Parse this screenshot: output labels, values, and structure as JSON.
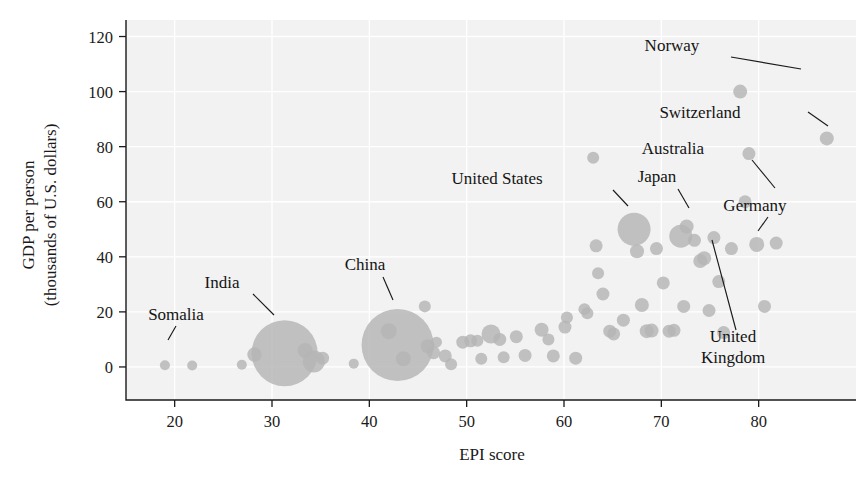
{
  "chart_data": {
    "type": "scatter",
    "title": "",
    "xlabel": "EPI score",
    "ylabel": "GDP per person\n(thousands of U.S. dollars)",
    "ylabel_line1": "GDP per person",
    "ylabel_line2": "(thousands of U.S. dollars)",
    "xlim": [
      15,
      90
    ],
    "ylim": [
      -12,
      126
    ],
    "xticks": [
      20,
      30,
      40,
      50,
      60,
      70,
      80
    ],
    "yticks": [
      0,
      20,
      40,
      60,
      80,
      100,
      120
    ],
    "grid": true,
    "legend": "none",
    "bubble_note": "Marker area encodes population",
    "colors": {
      "bubble": "#b4b4b4",
      "plot_background": "#f2f2f2",
      "gridline": "#ffffff",
      "axis": "#1a1a1a",
      "text": "#141414"
    },
    "annotations": [
      {
        "label": "Somalia",
        "lines": [
          "Somalia"
        ],
        "text_x": 176,
        "text_y": 320,
        "leader": [
          [
            176,
            326
          ],
          [
            168,
            340
          ]
        ]
      },
      {
        "label": "India",
        "lines": [
          "India"
        ],
        "text_x": 222,
        "text_y": 288,
        "leader": [
          [
            253,
            294
          ],
          [
            274,
            315
          ]
        ]
      },
      {
        "label": "China",
        "lines": [
          "China"
        ],
        "text_x": 365,
        "text_y": 270,
        "leader": [
          [
            383,
            277
          ],
          [
            393,
            300
          ]
        ]
      },
      {
        "label": "United States",
        "lines": [
          "United States"
        ],
        "text_x": 497,
        "text_y": 184,
        "leader": [
          [
            613,
            190
          ],
          [
            628,
            206
          ]
        ]
      },
      {
        "label": "Japan",
        "lines": [
          "Japan"
        ],
        "text_x": 657,
        "text_y": 182,
        "leader": [
          [
            678,
            189
          ],
          [
            689,
            208
          ]
        ]
      },
      {
        "label": "Australia",
        "lines": [
          "Australia"
        ],
        "text_x": 673,
        "text_y": 154,
        "leader": [
          [
            752,
            160
          ],
          [
            775,
            188
          ]
        ]
      },
      {
        "label": "Germany",
        "lines": [
          "Germany"
        ],
        "text_x": 755,
        "text_y": 211,
        "leader": [
          [
            768,
            217
          ],
          [
            758,
            231
          ]
        ]
      },
      {
        "label": "Switzerland",
        "lines": [
          "Switzerland"
        ],
        "text_x": 700,
        "text_y": 118,
        "leader": [
          [
            808,
            112
          ],
          [
            828,
            126
          ]
        ]
      },
      {
        "label": "Norway",
        "lines": [
          "Norway"
        ],
        "text_x": 672,
        "text_y": 51,
        "leader": [
          [
            731,
            57
          ],
          [
            801,
            69
          ]
        ]
      },
      {
        "label": "United Kingdom",
        "lines": [
          "United",
          "Kingdom"
        ],
        "text_x": 733,
        "text_y": 342,
        "leader": [
          [
            736,
            330
          ],
          [
            712,
            240
          ]
        ]
      }
    ],
    "points": [
      {
        "epi": 19.0,
        "gdp": 0.6,
        "r": 5.0,
        "name": "Somalia"
      },
      {
        "epi": 21.8,
        "gdp": 0.5,
        "r": 5.0
      },
      {
        "epi": 26.9,
        "gdp": 0.8,
        "r": 5.0
      },
      {
        "epi": 28.2,
        "gdp": 4.5,
        "r": 7.2
      },
      {
        "epi": 31.3,
        "gdp": 5.0,
        "r": 33.0,
        "name": "India"
      },
      {
        "epi": 33.4,
        "gdp": 6.0,
        "r": 7.5
      },
      {
        "epi": 34.3,
        "gdp": 2.0,
        "r": 11.0
      },
      {
        "epi": 35.2,
        "gdp": 3.2,
        "r": 6.5
      },
      {
        "epi": 38.4,
        "gdp": 1.2,
        "r": 5.0
      },
      {
        "epi": 42.9,
        "gdp": 8.0,
        "r": 36.0,
        "name": "China"
      },
      {
        "epi": 42.0,
        "gdp": 13.0,
        "r": 8.0
      },
      {
        "epi": 43.5,
        "gdp": 3.0,
        "r": 7.5
      },
      {
        "epi": 45.7,
        "gdp": 22.0,
        "r": 6.0
      },
      {
        "epi": 46.0,
        "gdp": 7.5,
        "r": 7.0
      },
      {
        "epi": 46.6,
        "gdp": 5.2,
        "r": 6.5
      },
      {
        "epi": 46.9,
        "gdp": 9.0,
        "r": 5.5
      },
      {
        "epi": 47.8,
        "gdp": 4.0,
        "r": 6.5
      },
      {
        "epi": 48.4,
        "gdp": 1.0,
        "r": 6.0
      },
      {
        "epi": 49.6,
        "gdp": 9.0,
        "r": 6.5
      },
      {
        "epi": 50.4,
        "gdp": 9.5,
        "r": 6.5
      },
      {
        "epi": 51.1,
        "gdp": 9.5,
        "r": 6.0
      },
      {
        "epi": 51.5,
        "gdp": 3.0,
        "r": 6.0
      },
      {
        "epi": 52.5,
        "gdp": 12.0,
        "r": 9.5
      },
      {
        "epi": 53.4,
        "gdp": 10.0,
        "r": 6.5
      },
      {
        "epi": 53.8,
        "gdp": 3.5,
        "r": 6.0
      },
      {
        "epi": 55.1,
        "gdp": 11.0,
        "r": 6.5
      },
      {
        "epi": 56.0,
        "gdp": 4.2,
        "r": 6.5
      },
      {
        "epi": 57.7,
        "gdp": 13.5,
        "r": 7.0
      },
      {
        "epi": 58.4,
        "gdp": 10.0,
        "r": 6.0
      },
      {
        "epi": 58.9,
        "gdp": 4.0,
        "r": 6.5
      },
      {
        "epi": 60.3,
        "gdp": 18.0,
        "r": 6.0
      },
      {
        "epi": 60.1,
        "gdp": 14.5,
        "r": 6.5
      },
      {
        "epi": 61.2,
        "gdp": 3.2,
        "r": 6.5
      },
      {
        "epi": 62.1,
        "gdp": 21.0,
        "r": 6.0
      },
      {
        "epi": 62.4,
        "gdp": 19.5,
        "r": 6.0
      },
      {
        "epi": 63.0,
        "gdp": 76.0,
        "r": 6.0
      },
      {
        "epi": 63.3,
        "gdp": 44.0,
        "r": 6.5
      },
      {
        "epi": 63.5,
        "gdp": 34.0,
        "r": 6.0
      },
      {
        "epi": 64.0,
        "gdp": 26.5,
        "r": 6.5
      },
      {
        "epi": 64.7,
        "gdp": 13.0,
        "r": 6.5
      },
      {
        "epi": 65.1,
        "gdp": 12.0,
        "r": 6.5
      },
      {
        "epi": 66.1,
        "gdp": 17.0,
        "r": 6.5
      },
      {
        "epi": 67.2,
        "gdp": 50.0,
        "r": 16.5,
        "name": "United States"
      },
      {
        "epi": 67.5,
        "gdp": 42.0,
        "r": 7.0
      },
      {
        "epi": 68.0,
        "gdp": 22.5,
        "r": 7.0
      },
      {
        "epi": 68.5,
        "gdp": 13.0,
        "r": 7.0
      },
      {
        "epi": 69.0,
        "gdp": 13.2,
        "r": 7.0
      },
      {
        "epi": 69.5,
        "gdp": 43.0,
        "r": 6.5
      },
      {
        "epi": 70.2,
        "gdp": 30.5,
        "r": 6.5
      },
      {
        "epi": 70.8,
        "gdp": 13.0,
        "r": 6.5
      },
      {
        "epi": 71.3,
        "gdp": 13.3,
        "r": 6.5
      },
      {
        "epi": 72.0,
        "gdp": 47.5,
        "r": 11.5,
        "name": "Japan"
      },
      {
        "epi": 72.6,
        "gdp": 51.0,
        "r": 7.0
      },
      {
        "epi": 72.3,
        "gdp": 22.0,
        "r": 6.5
      },
      {
        "epi": 73.4,
        "gdp": 46.0,
        "r": 6.5
      },
      {
        "epi": 74.0,
        "gdp": 38.5,
        "r": 7.0
      },
      {
        "epi": 74.4,
        "gdp": 39.5,
        "r": 7.0,
        "name": "United Kingdom"
      },
      {
        "epi": 74.9,
        "gdp": 20.5,
        "r": 6.5
      },
      {
        "epi": 75.4,
        "gdp": 47.0,
        "r": 6.5
      },
      {
        "epi": 75.9,
        "gdp": 31.0,
        "r": 6.5
      },
      {
        "epi": 76.4,
        "gdp": 12.5,
        "r": 6.5
      },
      {
        "epi": 77.2,
        "gdp": 43.0,
        "r": 6.5
      },
      {
        "epi": 78.1,
        "gdp": 100.0,
        "r": 7.0,
        "name": "Norway"
      },
      {
        "epi": 78.6,
        "gdp": 60.0,
        "r": 6.5,
        "name": "Australia"
      },
      {
        "epi": 79.0,
        "gdp": 77.5,
        "r": 6.5
      },
      {
        "epi": 79.8,
        "gdp": 44.5,
        "r": 7.5,
        "name": "Germany"
      },
      {
        "epi": 80.6,
        "gdp": 22.0,
        "r": 6.5
      },
      {
        "epi": 81.8,
        "gdp": 45.0,
        "r": 6.5
      },
      {
        "epi": 87.0,
        "gdp": 83.0,
        "r": 7.0,
        "name": "Switzerland"
      }
    ]
  }
}
